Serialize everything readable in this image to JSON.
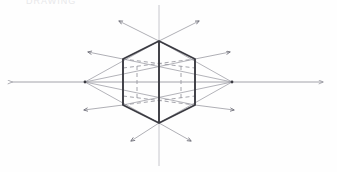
{
  "artwork": {
    "title": "Two-Point Perspective Cube Construction",
    "medium": "pencil sketch",
    "caption_text": "DRAWING",
    "background_color": "#fefefe",
    "ink_color": "#3b3b42",
    "light_ink_color": "#9a9aa2",
    "faint_ink_color": "#c2c2c8",
    "canvas": {
      "width": 337,
      "height": 172
    }
  },
  "geometry": {
    "horizon_line": {
      "name": "horizon-line",
      "y": 82,
      "x_start": 12,
      "x_end": 323,
      "arrow_start": true,
      "arrow_end": true
    },
    "vertical_axis": {
      "name": "vertical-center-line",
      "x": 159,
      "y_start": 5,
      "y_end": 166
    },
    "vanishing_points": [
      {
        "label": "VP-left",
        "x": 85,
        "y": 82
      },
      {
        "label": "VP-right",
        "x": 232,
        "y": 82
      }
    ],
    "cube_silhouette": {
      "name": "hexagon-outline",
      "points": [
        {
          "label": "top",
          "x": 159,
          "y": 41
        },
        {
          "label": "upper-right",
          "x": 195,
          "y": 59
        },
        {
          "label": "lower-right",
          "x": 195,
          "y": 105
        },
        {
          "label": "bottom",
          "x": 159,
          "y": 123
        },
        {
          "label": "lower-left",
          "x": 123,
          "y": 105
        },
        {
          "label": "upper-left",
          "x": 123,
          "y": 59
        }
      ]
    },
    "near_vertical_edge": {
      "name": "near-corner-edge",
      "x": 159,
      "y_top": 41,
      "y_bottom": 123
    },
    "construction_lines": [
      {
        "from": "top",
        "to": "VP-left"
      },
      {
        "from": "top",
        "to": "VP-right"
      },
      {
        "from": "bottom",
        "to": "VP-left"
      },
      {
        "from": "bottom",
        "to": "VP-right"
      },
      {
        "from": "upper-left",
        "to": "VP-right"
      },
      {
        "from": "lower-left",
        "to": "VP-right"
      },
      {
        "from": "upper-right",
        "to": "VP-left"
      },
      {
        "from": "lower-right",
        "to": "VP-left"
      }
    ],
    "hidden_edges_style": "dashed",
    "hidden_edges": [
      {
        "from_x": 123,
        "from_y": 68,
        "to_x": 195,
        "to_y": 59
      },
      {
        "from_x": 123,
        "from_y": 59,
        "to_x": 195,
        "to_y": 68
      },
      {
        "from_x": 123,
        "from_y": 96,
        "to_x": 195,
        "to_y": 105
      },
      {
        "from_x": 123,
        "from_y": 105,
        "to_x": 195,
        "to_y": 96
      },
      {
        "from_x": 137,
        "from_y": 66,
        "to_x": 137,
        "to_y": 99
      },
      {
        "from_x": 181,
        "from_y": 66,
        "to_x": 181,
        "to_y": 99
      }
    ],
    "radiating_arrows": [
      {
        "label": "arrow-up-left",
        "from_x": 159,
        "from_y": 41,
        "to_x": 119,
        "to_y": 21
      },
      {
        "label": "arrow-up-right",
        "from_x": 159,
        "from_y": 41,
        "to_x": 199,
        "to_y": 21
      },
      {
        "label": "arrow-left-up",
        "from_x": 123,
        "from_y": 59,
        "to_x": 88,
        "to_y": 52
      },
      {
        "label": "arrow-right-up",
        "from_x": 195,
        "from_y": 59,
        "to_x": 230,
        "to_y": 52
      },
      {
        "label": "arrow-left-down",
        "from_x": 123,
        "from_y": 105,
        "to_x": 84,
        "to_y": 110
      },
      {
        "label": "arrow-right-down",
        "from_x": 195,
        "from_y": 105,
        "to_x": 234,
        "to_y": 110
      },
      {
        "label": "arrow-down-left",
        "from_x": 159,
        "from_y": 123,
        "to_x": 131,
        "to_y": 141
      },
      {
        "label": "arrow-down-right",
        "from_x": 159,
        "from_y": 123,
        "to_x": 191,
        "to_y": 141
      }
    ]
  }
}
